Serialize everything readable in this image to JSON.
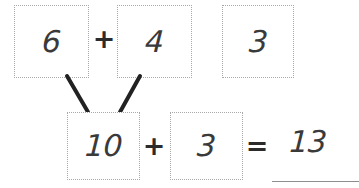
{
  "worksheet": {
    "title": "Make-ten addition strategy worksheet",
    "top_row": {
      "addend_1": {
        "value": "6",
        "name": "top-box-first-addend"
      },
      "operator_1": "+",
      "addend_2": {
        "value": "4",
        "name": "top-box-second-addend"
      },
      "addend_3": {
        "value": "3",
        "name": "top-box-third-addend"
      }
    },
    "bottom_row": {
      "sum_of_ten": {
        "value": "10",
        "name": "bottom-box-ten"
      },
      "operator_2": "+",
      "remaining_addend": {
        "value": "3",
        "name": "bottom-box-remaining"
      },
      "equals": "=",
      "total": "13"
    },
    "connectors": {
      "left_branch_label": "branch-from-6-to-10",
      "right_branch_label": "branch-from-4-to-10"
    },
    "colors": {
      "box_border": "#a8a8a8",
      "digit": "#3a3a3a",
      "operator": "#2b2b2b",
      "connector": "#222222",
      "rule": "#8e8e8e",
      "background": "#ffffff"
    }
  }
}
